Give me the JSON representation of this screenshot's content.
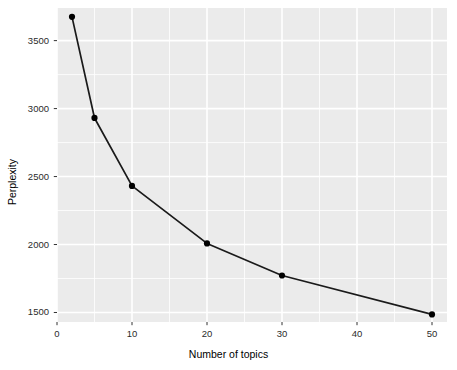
{
  "chart_data": {
    "type": "line",
    "title": "",
    "subtitle": "",
    "xlabel": "Number of topics",
    "ylabel": "Perplexity",
    "x": [
      2,
      5,
      10,
      20,
      30,
      50
    ],
    "values": [
      3675,
      2931,
      2431,
      2008,
      1772,
      1486
    ],
    "series": [
      {
        "name": "Perplexity",
        "x": [
          2,
          5,
          10,
          20,
          30,
          50
        ],
        "values": [
          3675,
          2931,
          2431,
          2008,
          1772,
          1486
        ]
      }
    ],
    "xlim": [
      0,
      52
    ],
    "ylim": [
      1430,
      3740
    ],
    "xticks": [
      0,
      10,
      20,
      30,
      40,
      50
    ],
    "xtick_labels": [
      "0",
      "10",
      "20",
      "30",
      "40",
      "50"
    ],
    "yticks": [
      1500,
      2000,
      2500,
      3000,
      3500
    ],
    "ytick_labels": [
      "1500",
      "2000",
      "2500",
      "3000",
      "3500"
    ],
    "grid": true,
    "legend": "none",
    "marker": "filled-circle",
    "line_color": "#1a1a1a",
    "marker_color": "#000000",
    "panel_background": "#ebebeb",
    "grid_color": "#ffffff",
    "plot_background": "#ffffff"
  },
  "axes": {
    "x_title": "Number of topics",
    "y_title": "Perplexity"
  }
}
